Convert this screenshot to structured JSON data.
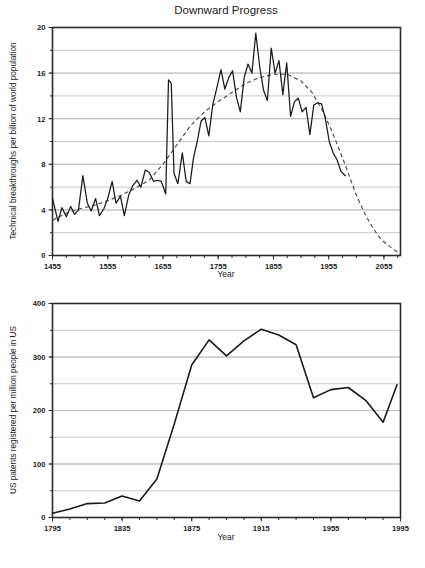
{
  "figure": {
    "title": "Downward Progress",
    "background_color": "#ffffff",
    "line_color": "#1a1a1a",
    "grid_color": "#b9b9b9",
    "trend_color": "#4a4a4a"
  },
  "chart_data": [
    {
      "type": "line",
      "id": "technical-breakthroughs",
      "title": "Downward Progress",
      "xlabel": "Year",
      "ylabel": "Technical breakthroughs per billion of world population",
      "xlim": [
        1455,
        2085
      ],
      "ylim": [
        0,
        20
      ],
      "xticks": [
        1455,
        1555,
        1655,
        1755,
        1855,
        1955,
        2055
      ],
      "xtick_labels": [
        "1455",
        "1555",
        "1655",
        "1755",
        "1855",
        "1955",
        "2055"
      ],
      "yticks": [
        0,
        4,
        8,
        12,
        16,
        20
      ],
      "ytick_labels": [
        "0",
        "4",
        "8",
        "12",
        "16",
        "20"
      ],
      "gridlines_y": [
        2,
        4,
        6,
        8,
        10,
        12,
        14,
        16,
        18
      ],
      "grid": true,
      "legend": "none",
      "series": [
        {
          "name": "Technical breakthroughs",
          "style": "solid",
          "x": [
            1455,
            1465,
            1472,
            1480,
            1488,
            1495,
            1502,
            1510,
            1518,
            1525,
            1533,
            1540,
            1548,
            1555,
            1563,
            1570,
            1578,
            1585,
            1593,
            1600,
            1608,
            1615,
            1623,
            1630,
            1638,
            1645,
            1652,
            1660,
            1665,
            1670,
            1675,
            1682,
            1690,
            1697,
            1704,
            1710,
            1717,
            1724,
            1731,
            1738,
            1745,
            1752,
            1760,
            1767,
            1774,
            1781,
            1788,
            1795,
            1802,
            1809,
            1816,
            1823,
            1830,
            1837,
            1844,
            1851,
            1858,
            1865,
            1872,
            1879,
            1886,
            1893,
            1900,
            1907,
            1914,
            1921,
            1928,
            1935,
            1942,
            1949,
            1956,
            1963,
            1970,
            1977,
            1985
          ],
          "y": [
            5.0,
            3.0,
            4.2,
            3.4,
            4.3,
            3.6,
            4.0,
            7.0,
            4.6,
            3.9,
            5.0,
            3.5,
            4.1,
            5.0,
            6.5,
            4.6,
            5.2,
            3.5,
            5.3,
            6.1,
            6.6,
            6.0,
            7.5,
            7.3,
            6.5,
            6.6,
            6.5,
            5.4,
            15.4,
            15.1,
            7.2,
            6.3,
            9.0,
            6.5,
            6.3,
            8.5,
            10.0,
            11.8,
            12.1,
            10.5,
            13.2,
            14.6,
            16.3,
            14.6,
            15.6,
            16.2,
            13.9,
            12.6,
            15.6,
            16.8,
            16.0,
            19.5,
            16.6,
            14.5,
            13.6,
            18.2,
            16.0,
            17.1,
            14.1,
            16.9,
            12.2,
            13.5,
            13.8,
            12.6,
            13.0,
            10.6,
            13.2,
            13.4,
            13.3,
            12.0,
            10.0,
            9.0,
            8.4,
            7.4,
            7.0
          ]
        },
        {
          "name": "Trend",
          "style": "dashed",
          "x": [
            1455,
            1480,
            1505,
            1530,
            1555,
            1580,
            1605,
            1630,
            1655,
            1680,
            1705,
            1730,
            1755,
            1780,
            1805,
            1830,
            1855,
            1880,
            1905,
            1925,
            1945,
            1960,
            1975,
            1990,
            2005,
            2020,
            2035,
            2050,
            2065,
            2085
          ],
          "y": [
            3.1,
            3.7,
            4.1,
            4.4,
            4.8,
            5.3,
            5.9,
            6.6,
            8.0,
            9.7,
            11.4,
            12.6,
            13.5,
            14.3,
            15.1,
            15.6,
            15.9,
            15.9,
            15.3,
            14.3,
            12.6,
            11.0,
            9.2,
            7.3,
            5.3,
            3.7,
            2.4,
            1.4,
            0.8,
            0.1
          ]
        }
      ]
    },
    {
      "type": "line",
      "id": "us-patents",
      "title": "",
      "xlabel": "Year",
      "ylabel": "US patents registered per million people in US",
      "xlim": [
        1795,
        1995
      ],
      "ylim": [
        0,
        400
      ],
      "xticks": [
        1795,
        1835,
        1875,
        1915,
        1955,
        1995
      ],
      "xtick_labels": [
        "1795",
        "1835",
        "1875",
        "1915",
        "1955",
        "1995"
      ],
      "yticks": [
        0,
        100,
        200,
        300,
        400
      ],
      "ytick_labels": [
        "0",
        "100",
        "200",
        "300",
        "400"
      ],
      "gridlines_y": [
        50,
        100,
        150,
        200,
        250,
        300,
        350
      ],
      "grid": true,
      "legend": "none",
      "series": [
        {
          "name": "US patents registered per million people",
          "style": "solid",
          "x": [
            1795,
            1805,
            1815,
            1825,
            1835,
            1845,
            1855,
            1865,
            1875,
            1885,
            1895,
            1905,
            1915,
            1925,
            1935,
            1945,
            1955,
            1965,
            1975,
            1985,
            1993
          ],
          "y": [
            8,
            16,
            26,
            27,
            40,
            31,
            72,
            175,
            285,
            332,
            302,
            330,
            352,
            341,
            323,
            224,
            239,
            243,
            219,
            178,
            248
          ]
        }
      ]
    }
  ]
}
